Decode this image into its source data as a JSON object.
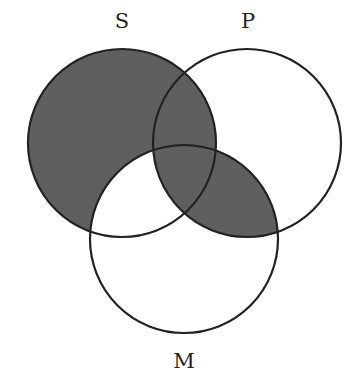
{
  "diagram": {
    "type": "venn-3",
    "sets": [
      {
        "id": "S",
        "label": "S",
        "cx": 122,
        "cy": 143,
        "r": 94
      },
      {
        "id": "P",
        "label": "P",
        "cx": 247,
        "cy": 143,
        "r": 94
      },
      {
        "id": "M",
        "label": "M",
        "cx": 184,
        "cy": 239,
        "r": 94
      }
    ],
    "shaded_regions": [
      "S only",
      "S∩P not M",
      "S∩P∩M",
      "P∩M not S"
    ],
    "unshaded_regions": [
      "P only",
      "S∩M not P",
      "M only"
    ],
    "colors": {
      "shade": "#5f5f5f",
      "stroke": "#222222",
      "background": "#ffffff"
    }
  },
  "labels": {
    "S": "S",
    "P": "P",
    "M": "M"
  }
}
